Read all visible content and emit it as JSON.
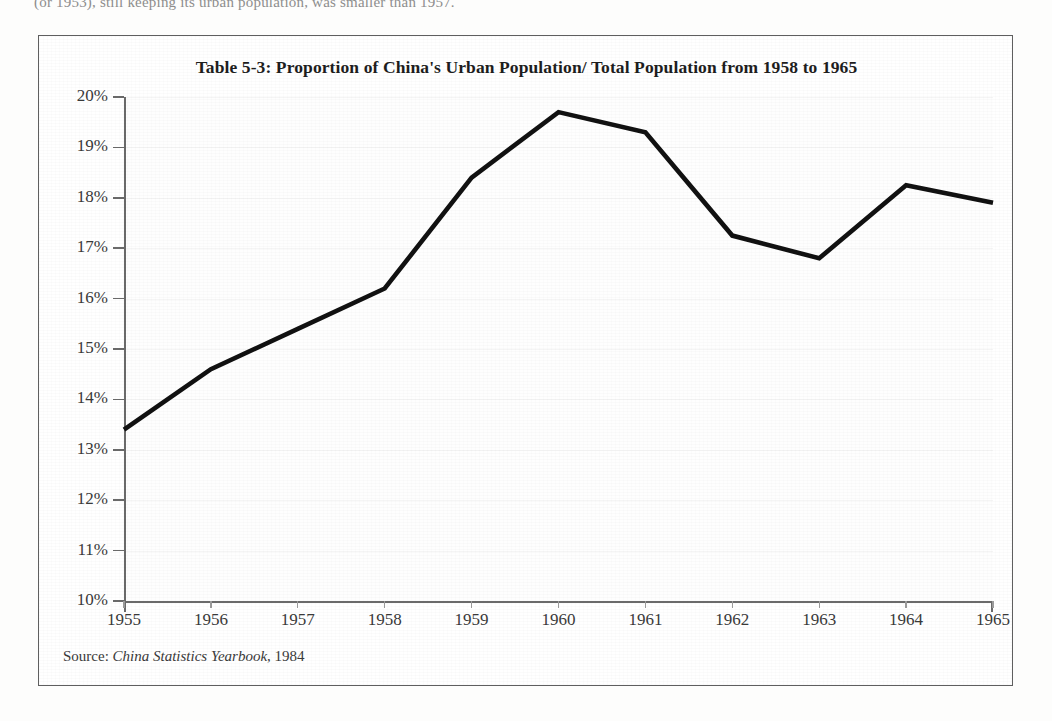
{
  "page": {
    "top_cropped_text": "(or 1953), still keeping its urban population, was smaller than 1957."
  },
  "figure": {
    "title": "Table 5-3: Proportion of China's Urban Population/ Total Population from 1958 to 1965",
    "source_prefix": "Source:",
    "source_title": "China Statistics Yearbook",
    "source_year": ", 1984"
  },
  "chart_data": {
    "type": "line",
    "title": "Table 5-3: Proportion of China's Urban Population/ Total Population from 1958 to 1965",
    "xlabel": "",
    "ylabel": "",
    "x": [
      1955,
      1956,
      1957,
      1958,
      1959,
      1960,
      1961,
      1962,
      1963,
      1964,
      1965
    ],
    "categories": [
      "1955",
      "1956",
      "1957",
      "1958",
      "1959",
      "1960",
      "1961",
      "1962",
      "1963",
      "1964",
      "1965"
    ],
    "values": [
      13.4,
      14.6,
      15.4,
      16.2,
      18.4,
      19.7,
      19.3,
      17.25,
      16.8,
      18.25,
      17.9
    ],
    "series": [
      {
        "name": "Urban population / total population",
        "values": [
          13.4,
          14.6,
          15.4,
          16.2,
          18.4,
          19.7,
          19.3,
          17.25,
          16.8,
          18.25,
          17.9
        ]
      }
    ],
    "ylim": [
      10,
      20
    ],
    "yticks": [
      10,
      11,
      12,
      13,
      14,
      15,
      16,
      17,
      18,
      19,
      20
    ],
    "ytick_labels": [
      "10%",
      "11%",
      "12%",
      "13%",
      "14%",
      "15%",
      "16%",
      "17%",
      "18%",
      "19%",
      "20%"
    ],
    "xlim": [
      1955,
      1965
    ],
    "grid": true,
    "legend": false,
    "line_color": "#111111",
    "line_width": 4.6,
    "units": "percent"
  }
}
